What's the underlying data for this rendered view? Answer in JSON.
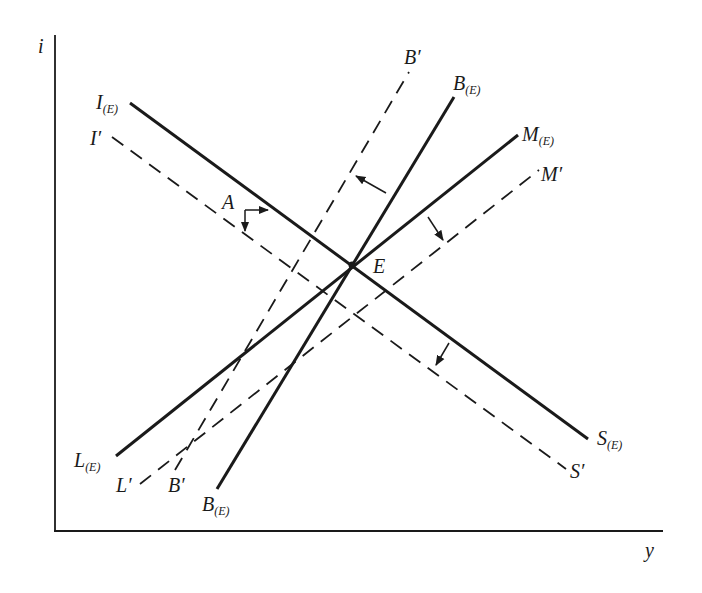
{
  "diagram": {
    "axes": {
      "y_axis_label": "i",
      "x_axis_label": "y"
    },
    "points": {
      "equilibrium": "E",
      "point_a": "A"
    },
    "curves": {
      "is_solid": {
        "main": "I",
        "sub": "(E)",
        "end_main": "S",
        "end_sub": "(E)",
        "style": "solid"
      },
      "is_dashed": {
        "main": "I",
        "prime": "′",
        "end_main": "S",
        "end_prime": "′",
        "style": "dashed"
      },
      "lm_solid": {
        "main": "M",
        "sub": "(E)",
        "end_main": "L",
        "end_sub": "(E)",
        "style": "solid"
      },
      "lm_dashed": {
        "main": "M",
        "prime": "′",
        "end_main": "L",
        "end_prime": "′",
        "style": "dashed"
      },
      "bp_solid": {
        "main": "B",
        "sub": "(E)",
        "end_main": "B",
        "end_sub": "(E)",
        "style": "solid"
      },
      "bp_dashed": {
        "main": "B",
        "prime": "′",
        "end_main": "B",
        "end_prime": "′",
        "style": "dashed"
      }
    },
    "colors": {
      "ink": "#1a1a1a",
      "background": "#ffffff"
    }
  }
}
